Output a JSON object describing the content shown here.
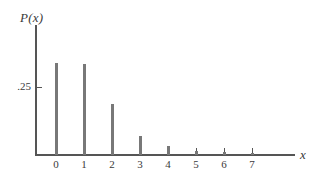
{
  "figure": {
    "axis_label_y": "P(x)",
    "axis_label_x": "x",
    "y_tick_label": ".25",
    "bar_color": "#787878",
    "axis_color": "#555555",
    "background": "#ffffff"
  },
  "chart_data": {
    "type": "bar",
    "title": "",
    "subtitle": "",
    "xlabel": "x",
    "ylabel": "P(x)",
    "categories": [
      "0",
      "1",
      "2",
      "3",
      "4",
      "5",
      "6",
      "7"
    ],
    "values": [
      0.342,
      0.338,
      0.191,
      0.07,
      0.033,
      0.015,
      0.01,
      0.008
    ],
    "x": [
      0,
      1,
      2,
      3,
      4,
      5,
      6,
      7
    ],
    "xlim": [
      -0.35,
      8.5
    ],
    "ylim": [
      0,
      0.48
    ],
    "xticks": [
      "0",
      "1",
      "2",
      "3",
      "4",
      "5",
      "6",
      "7"
    ],
    "yticks": [
      ".25"
    ],
    "ytick_values": [
      0.25
    ],
    "grid": false,
    "legend": null,
    "annotations": []
  }
}
